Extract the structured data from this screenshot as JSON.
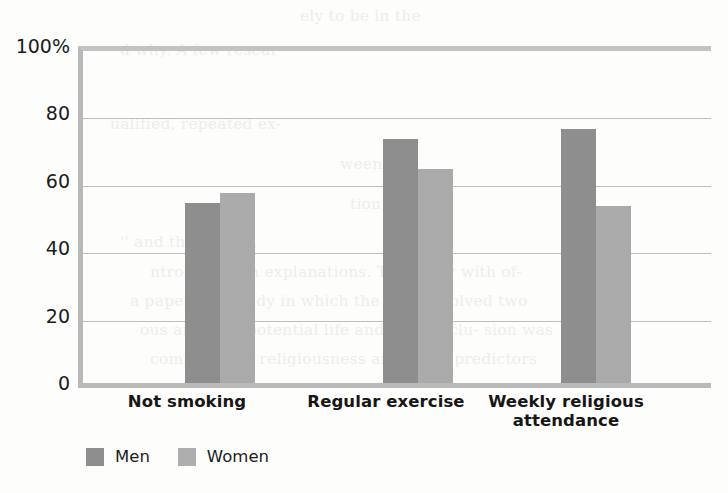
{
  "chart_data": {
    "type": "bar",
    "title": "",
    "subtitle": "",
    "xlabel": "",
    "ylabel": "",
    "ylim": [
      0,
      100
    ],
    "yticks": [
      "100%",
      "80",
      "60",
      "40",
      "20",
      "0"
    ],
    "ytick_values": [
      100,
      80,
      60,
      40,
      20,
      0
    ],
    "grid": true,
    "legend_position": "bottom-left",
    "categories": [
      "Not smoking",
      "Regular exercise",
      "Weekly religious attendance"
    ],
    "series": [
      {
        "name": "Men",
        "color": "#8e8e8e",
        "values": [
          55,
          74,
          77
        ]
      },
      {
        "name": "Women",
        "color": "#aaaaaa",
        "values": [
          58,
          65,
          54
        ]
      }
    ]
  },
  "axis": {
    "y": {
      "ticks": [
        {
          "label": "100%",
          "value": 100
        },
        {
          "label": "80",
          "value": 80
        },
        {
          "label": "60",
          "value": 60
        },
        {
          "label": "40",
          "value": 40
        },
        {
          "label": "20",
          "value": 20
        },
        {
          "label": "0",
          "value": 0
        }
      ]
    },
    "x": {
      "categories": [
        {
          "line1": "Not smoking",
          "line2": ""
        },
        {
          "line1": "Regular exercise",
          "line2": ""
        },
        {
          "line1": "Weekly religious",
          "line2": "attendance"
        }
      ]
    }
  },
  "legend": {
    "items": [
      {
        "label": "Men",
        "color": "#8e8e8e"
      },
      {
        "label": "Women",
        "color": "#aeaeae"
      }
    ]
  },
  "background_bleed": {
    "lines": [
      "ely to be  in  the",
      "d why. A few resear-",
      "ualified, repeated ex-",
      "ween  reli-",
      "tion, and",
      "'' and the  script).",
      "ntrols  certain  explanations.  The  study with  of-",
      "a paper in a study in which the data  involved two",
      "ous and  sub-  potential  life  and  the  conclu-  sion  was",
      "comprised  of  religiousness  and  other  predictors"
    ]
  }
}
